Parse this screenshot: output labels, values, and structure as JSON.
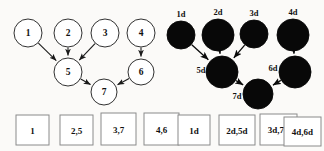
{
  "figure": {
    "background_color": "#fbfaf8",
    "ink_color": "#111111",
    "box_stroke_color": "#8a8a8a"
  },
  "left_diagram": {
    "name": "open-node-dag",
    "node_style": "open-circle",
    "nodes": [
      {
        "id": "n1",
        "label": "1",
        "cx": 28,
        "cy": 33,
        "r": 14
      },
      {
        "id": "n2",
        "label": "2",
        "cx": 68,
        "cy": 33,
        "r": 14
      },
      {
        "id": "n3",
        "label": "3",
        "cx": 105,
        "cy": 33,
        "r": 14
      },
      {
        "id": "n4",
        "label": "4",
        "cx": 141,
        "cy": 33,
        "r": 14
      },
      {
        "id": "n5",
        "label": "5",
        "cx": 68,
        "cy": 72,
        "r": 14
      },
      {
        "id": "n6",
        "label": "6",
        "cx": 141,
        "cy": 72,
        "r": 13
      },
      {
        "id": "n7",
        "label": "7",
        "cx": 104,
        "cy": 92,
        "r": 13
      }
    ],
    "edges": [
      {
        "from": "n1",
        "to": "n5"
      },
      {
        "from": "n2",
        "to": "n5"
      },
      {
        "from": "n3",
        "to": "n5"
      },
      {
        "from": "n4",
        "to": "n6"
      },
      {
        "from": "n5",
        "to": "n7"
      },
      {
        "from": "n6",
        "to": "n7"
      }
    ],
    "boxes": [
      {
        "label": "1",
        "x": 16,
        "y": 115,
        "w": 33,
        "h": 30
      },
      {
        "label": "2,5",
        "x": 60,
        "y": 115,
        "w": 33,
        "h": 30
      },
      {
        "label": "3,7",
        "x": 101,
        "y": 113,
        "w": 35,
        "h": 32
      },
      {
        "label": "4,6",
        "x": 144,
        "y": 113,
        "w": 35,
        "h": 32
      }
    ]
  },
  "right_diagram": {
    "name": "filled-node-dag",
    "node_style": "filled-circle",
    "nodes": [
      {
        "id": "d1",
        "label": "1d",
        "cx": 181,
        "cy": 35,
        "r": 14,
        "label_dx": 0,
        "label_dy": -21
      },
      {
        "id": "d2",
        "label": "2d",
        "cx": 218,
        "cy": 35,
        "r": 16,
        "label_dx": 0,
        "label_dy": -23
      },
      {
        "id": "d3",
        "label": "3d",
        "cx": 254,
        "cy": 34,
        "r": 14,
        "label_dx": 0,
        "label_dy": -21
      },
      {
        "id": "d4",
        "label": "4d",
        "cx": 293,
        "cy": 35,
        "r": 16,
        "label_dx": 0,
        "label_dy": -23
      },
      {
        "id": "d5",
        "label": "5d",
        "cx": 222,
        "cy": 72,
        "r": 16,
        "label_dx": -21,
        "label_dy": -2
      },
      {
        "id": "d6",
        "label": "6d",
        "cx": 295,
        "cy": 72,
        "r": 16,
        "label_dx": -22,
        "label_dy": -4
      },
      {
        "id": "d7",
        "label": "7d",
        "cx": 258,
        "cy": 94,
        "r": 15,
        "label_dx": -21,
        "label_dy": 2
      }
    ],
    "edges": [
      {
        "from": "d1",
        "to": "d5"
      },
      {
        "from": "d2",
        "to": "d5"
      },
      {
        "from": "d3",
        "to": "d5"
      },
      {
        "from": "d4",
        "to": "d6"
      },
      {
        "from": "d5",
        "to": "d7"
      },
      {
        "from": "d6",
        "to": "d7"
      }
    ],
    "boxes": [
      {
        "label": "1d",
        "x": 178,
        "y": 115,
        "w": 32,
        "h": 30
      },
      {
        "label": "2d,5d",
        "x": 219,
        "y": 115,
        "w": 36,
        "h": 30
      },
      {
        "label": "3d,7d",
        "x": 260,
        "y": 114,
        "w": 37,
        "h": 31
      },
      {
        "label": "4d,6d",
        "x": 284,
        "y": 117,
        "w": 37,
        "h": 29
      }
    ]
  }
}
